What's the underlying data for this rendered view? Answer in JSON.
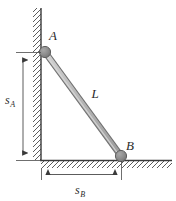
{
  "figure": {
    "type": "mechanics-diagram",
    "width": 176,
    "height": 201,
    "background_color": "#ffffff"
  },
  "labels": {
    "node_a": "A",
    "node_b": "B",
    "rod_length": "L",
    "dim_vertical_base": "s",
    "dim_vertical_sub": "A",
    "dim_horizontal_base": "s",
    "dim_horizontal_sub": "B"
  },
  "colors": {
    "line": "#3a3a3a",
    "hatch": "#4a4a4a",
    "rod_fill": "#b9b9b9",
    "rod_stroke": "#6e6e6e",
    "node_fill": "#8a8a8a",
    "node_stroke": "#5a5a5a",
    "dim_line": "#4a4a4a",
    "text": "#2b2b2b"
  },
  "geometry": {
    "wall_x": 41,
    "wall_top_y": 8,
    "wall_bottom_y": 160,
    "ground_y": 160,
    "ground_left_x": 41,
    "ground_right_x": 172,
    "node_a": {
      "x": 45,
      "y": 52,
      "r": 5.5
    },
    "node_b": {
      "x": 121,
      "y": 156,
      "r": 5.5
    },
    "rod_width": 5,
    "dim_vertical_x": 23,
    "dim_vertical_from_y": 52,
    "dim_vertical_to_y": 160,
    "dim_horizontal_y": 174,
    "dim_horizontal_from_x": 41,
    "dim_horizontal_to_x": 121
  }
}
